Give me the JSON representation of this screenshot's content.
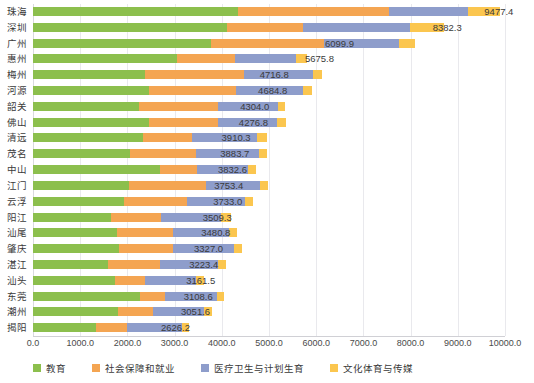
{
  "chart_data": {
    "type": "bar",
    "orientation": "horizontal",
    "stacked": true,
    "title": "",
    "subtitle": "",
    "xlabel": "",
    "ylabel": "",
    "xlim": [
      0,
      10000
    ],
    "grid": true,
    "legend_position": "bottom",
    "xticks": [
      "0.0",
      "1000.0",
      "2000.0",
      "3000.0",
      "4000.0",
      "5000.0",
      "6000.0",
      "7000.0",
      "8000.0",
      "9000.0",
      "10000.0"
    ],
    "xtick_values": [
      0,
      1000,
      2000,
      3000,
      4000,
      5000,
      6000,
      7000,
      8000,
      9000,
      10000
    ],
    "categories": [
      "珠海",
      "深圳",
      "广州",
      "惠州",
      "梅州",
      "河源",
      "韶关",
      "佛山",
      "清远",
      "茂名",
      "中山",
      "江门",
      "云浮",
      "阳江",
      "汕尾",
      "肇庆",
      "湛江",
      "汕头",
      "东莞",
      "潮州",
      "揭阳"
    ],
    "series": [
      {
        "name": "教育",
        "color": "#8cbf4d",
        "values": [
          4350,
          4100,
          3780,
          3060,
          2380,
          2460,
          2250,
          2460,
          2330,
          2060,
          2700,
          2040,
          1930,
          1660,
          1780,
          1830,
          1580,
          1740,
          2270,
          1810,
          1330
        ]
      },
      {
        "name": "社会保障和就业",
        "color": "#f4a552",
        "values": [
          3200,
          1620,
          2390,
          1230,
          2090,
          1840,
          1670,
          1460,
          1030,
          1390,
          780,
          1620,
          1330,
          1050,
          1190,
          1140,
          1120,
          630,
          520,
          730,
          670
        ]
      },
      {
        "name": "医疗卫生与计划生育",
        "color": "#8e9dcb",
        "values": [
          1670,
          2270,
          1580,
          1280,
          1460,
          1430,
          1280,
          1260,
          1380,
          1330,
          1080,
          1150,
          1240,
          1280,
          1180,
          1280,
          1210,
          1090,
          1100,
          1080,
          1150
        ]
      },
      {
        "name": "文化体育与传媒",
        "color": "#fbc64f",
        "values": [
          680,
          710,
          350,
          230,
          200,
          180,
          140,
          180,
          220,
          180,
          160,
          160,
          160,
          200,
          170,
          180,
          180,
          160,
          160,
          180,
          150
        ]
      }
    ],
    "totals": [
      9477.4,
      8382.3,
      6099.9,
      5675.8,
      4716.8,
      4684.8,
      4304.0,
      4276.8,
      3910.3,
      3883.7,
      3832.6,
      3753.4,
      3733.0,
      3509.3,
      3480.8,
      3327.0,
      3223.4,
      3161.5,
      3108.6,
      3051.6,
      2626.2
    ],
    "total_labels": [
      "9477.4",
      "8382.3",
      "6099.9",
      "5675.8",
      "4716.8",
      "4684.8",
      "4304.0",
      "4276.8",
      "3910.3",
      "3883.7",
      "3832.6",
      "3753.4",
      "3733.0",
      "3509.3",
      "3480.8",
      "3327.0",
      "3223.4",
      "3161.5",
      "3108.6",
      "3051.6",
      "2626.2"
    ]
  },
  "legend": {
    "items": [
      {
        "label": "教育",
        "color": "#8cbf4d"
      },
      {
        "label": "社会保障和就业",
        "color": "#f4a552"
      },
      {
        "label": "医疗卫生与计划生育",
        "color": "#8e9dcb"
      },
      {
        "label": "文化体育与传媒",
        "color": "#fbc64f"
      }
    ]
  },
  "colors": {
    "education": "#8cbf4d",
    "social_security": "#f4a552",
    "healthcare": "#8e9dcb",
    "culture_media": "#fbc64f",
    "gridline": "#e9e9ed",
    "text": "#3a3a3a"
  }
}
